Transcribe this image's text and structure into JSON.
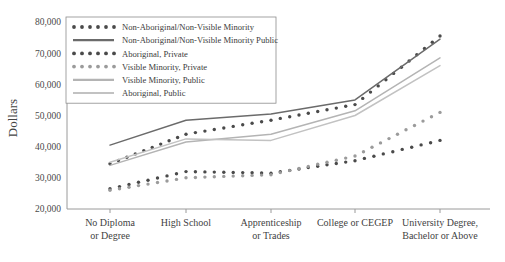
{
  "chart_data": {
    "type": "line",
    "title": "",
    "xlabel": "",
    "ylabel": "Dollars",
    "categories": [
      "No Diploma or Degree",
      "High School",
      "Apprenticeship or Trades",
      "College or CEGEP",
      "University Degree, Bachelor or Above"
    ],
    "category_lines": [
      [
        "No Diploma",
        "or Degree"
      ],
      [
        "High School",
        ""
      ],
      [
        "Apprenticeship",
        "or Trades"
      ],
      [
        "College or CEGEP",
        ""
      ],
      [
        "University Degree,",
        "Bachelor or Above"
      ]
    ],
    "ylim": [
      20000,
      80000
    ],
    "yticks": [
      20000,
      30000,
      40000,
      50000,
      60000,
      70000,
      80000
    ],
    "ytick_labels": [
      "20,000",
      "30,000",
      "40,000",
      "50,000",
      "60,000",
      "70,000",
      "80,000"
    ],
    "grid": false,
    "legend_position": "top-left",
    "series": [
      {
        "name": "Non-Aboriginal/Non-Visible Minority",
        "style": "dotted",
        "color": "#4a4a4a",
        "values": [
          34500,
          44000,
          48500,
          53500,
          75500
        ]
      },
      {
        "name": "Non-Aboriginal/Non-Visible Minority Public",
        "style": "solid",
        "color": "#6b6b6b",
        "values": [
          40500,
          48500,
          50500,
          55000,
          74500
        ]
      },
      {
        "name": "Aboriginal, Private",
        "style": "dotted",
        "color": "#4a4a4a",
        "values": [
          26500,
          32000,
          31500,
          35500,
          42000
        ]
      },
      {
        "name": "Visible Minority, Private",
        "style": "dotted",
        "color": "#9b9b9b",
        "values": [
          26000,
          30000,
          31000,
          37000,
          51000
        ]
      },
      {
        "name": "Visible Minority, Public",
        "style": "solid",
        "color": "#b4b4b4",
        "values": [
          34000,
          41500,
          44000,
          51500,
          68500
        ]
      },
      {
        "name": "Aboriginal, Public",
        "style": "solid",
        "color": "#c2c2c2",
        "values": [
          35000,
          42500,
          42000,
          50000,
          66000
        ]
      }
    ]
  },
  "legend": {
    "entries": [
      {
        "label": "Non-Aboriginal/Non-Visible Minority",
        "style": "dotted",
        "color": "#4a4a4a"
      },
      {
        "label": "Non-Aboriginal/Non-Visible Minority Public",
        "style": "solid",
        "color": "#6b6b6b"
      },
      {
        "label": "Aboriginal, Private",
        "style": "dotted",
        "color": "#4a4a4a"
      },
      {
        "label": "Visible Minority, Private",
        "style": "dotted",
        "color": "#9b9b9b"
      },
      {
        "label": "Visible Minority, Public",
        "style": "solid",
        "color": "#b4b4b4"
      },
      {
        "label": "Aboriginal, Public",
        "style": "solid",
        "color": "#c2c2c2"
      }
    ]
  },
  "axes": {
    "y_title": "Dollars",
    "axis_color": "#9a9a9a"
  }
}
